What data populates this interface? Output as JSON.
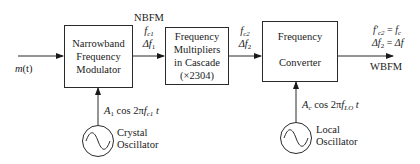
{
  "diagram": {
    "input": {
      "label_var": "m",
      "label_arg": "(t)"
    },
    "blocks": [
      {
        "id": "nbfm-modulator",
        "lines": [
          "Narrowband",
          "Frequency",
          "Modulator"
        ]
      },
      {
        "id": "multipliers",
        "lines": [
          "Frequency",
          "Multipliers",
          "in Cascade",
          "(×2304)"
        ]
      },
      {
        "id": "converter",
        "lines": [
          "Frequency",
          "",
          "Converter"
        ]
      }
    ],
    "signal_1": {
      "title": "NBFM",
      "freq_var": "f",
      "freq_sub": "c1",
      "dev_var": "Δf",
      "dev_sub": "1"
    },
    "signal_2": {
      "freq_var": "f",
      "freq_sub": "c2",
      "dev_var": "Δf",
      "dev_sub": "2"
    },
    "output": {
      "eq1_lhs": "f′",
      "eq1_lhs_sub": "c2",
      "eq1_rhs": "f",
      "eq1_rhs_sub": "c",
      "eq2_lhs": "Δf",
      "eq2_lhs_sub": "2",
      "eq2_rhs": "Δf",
      "equals": "=",
      "label": "WBFM"
    },
    "oscillators": [
      {
        "id": "crystal",
        "name_lines": [
          "Crystal",
          "Oscillator"
        ],
        "amp": "A",
        "amp_sub": "1",
        "cos": "cos 2π",
        "freq": "f",
        "freq_sub": "c1",
        "t": "t"
      },
      {
        "id": "local",
        "name_lines": [
          "Local",
          "Oscillator"
        ],
        "amp": "A",
        "amp_sub": "c",
        "cos": "cos 2π",
        "freq": "f",
        "freq_sub": "LO",
        "t": "t"
      }
    ],
    "colors": {
      "stroke": "#2a2a2a",
      "text": "#1a1a1a",
      "background": "#ffffff"
    }
  }
}
